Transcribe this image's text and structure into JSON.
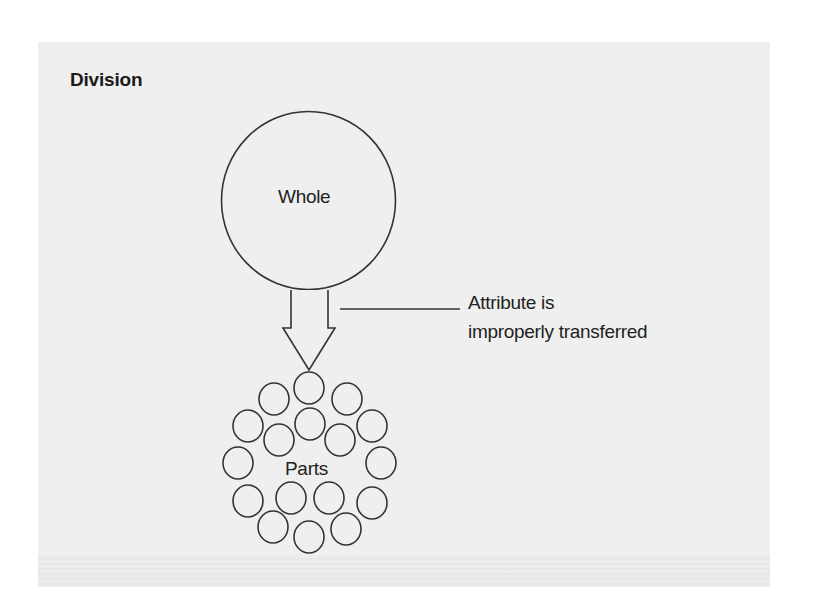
{
  "diagram": {
    "title": "Division",
    "whole": {
      "label": "Whole",
      "shape": "circle",
      "cx": 308.5,
      "cy": 200.5,
      "rx": 87,
      "ry": 89
    },
    "arrow": {
      "direction": "down",
      "from": "whole",
      "to": "parts",
      "shaft": {
        "x1": 291,
        "x2": 328,
        "y_top": 290,
        "y_bottom": 328
      },
      "head": {
        "x_left": 283,
        "x_right": 335,
        "y_top": 328,
        "tip_x": 309,
        "tip_y": 370
      }
    },
    "annotation": {
      "lines": [
        "Attribute is",
        "improperly transferred"
      ],
      "leader_line": {
        "x1": 340,
        "y1": 309,
        "x2": 460,
        "y2": 309
      }
    },
    "parts": {
      "label": "Parts",
      "count": 17,
      "circle_rx": 15,
      "circle_ry": 16,
      "circles": [
        {
          "cx": 309,
          "cy": 388
        },
        {
          "cx": 274,
          "cy": 399
        },
        {
          "cx": 347,
          "cy": 399
        },
        {
          "cx": 248,
          "cy": 426
        },
        {
          "cx": 310,
          "cy": 424
        },
        {
          "cx": 372,
          "cy": 426
        },
        {
          "cx": 279,
          "cy": 440
        },
        {
          "cx": 340,
          "cy": 440
        },
        {
          "cx": 238,
          "cy": 463
        },
        {
          "cx": 381,
          "cy": 463
        },
        {
          "cx": 248,
          "cy": 501
        },
        {
          "cx": 291,
          "cy": 498
        },
        {
          "cx": 329,
          "cy": 498
        },
        {
          "cx": 372,
          "cy": 503
        },
        {
          "cx": 273,
          "cy": 527
        },
        {
          "cx": 309,
          "cy": 537
        },
        {
          "cx": 346,
          "cy": 529
        }
      ]
    },
    "colors": {
      "background": "#ffffff",
      "panel": "#efefef",
      "stroke": "#333333",
      "text": "#222222"
    }
  }
}
